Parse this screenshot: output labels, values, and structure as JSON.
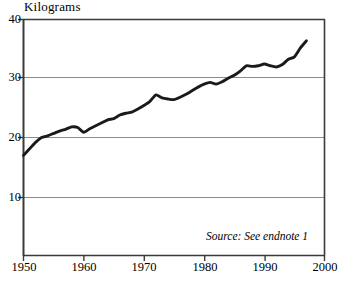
{
  "chart_data": {
    "type": "line",
    "title": "",
    "ylabel": "Kilograms",
    "xlabel": "",
    "ylim": [
      0,
      40
    ],
    "xlim": [
      1950,
      2000
    ],
    "ytick_labels": [
      "40",
      "30",
      "20",
      "10"
    ],
    "ytick_values": [
      40,
      30,
      20,
      10
    ],
    "xtick_labels": [
      "1950",
      "1960",
      "1970",
      "1980",
      "1990",
      "2000"
    ],
    "xtick_values": [
      1950,
      1960,
      1970,
      1980,
      1990,
      2000
    ],
    "grid": "horizontal",
    "legend": "none",
    "annotations": [
      {
        "name": "source-note",
        "text": "Source: See endnote 1"
      }
    ],
    "series": [
      {
        "name": "Kilograms per person",
        "color": "#1a1a1a",
        "x": [
          1950,
          1951,
          1952,
          1953,
          1954,
          1955,
          1956,
          1957,
          1958,
          1959,
          1960,
          1961,
          1962,
          1963,
          1964,
          1965,
          1966,
          1967,
          1968,
          1969,
          1970,
          1971,
          1972,
          1973,
          1974,
          1975,
          1976,
          1977,
          1978,
          1979,
          1980,
          1981,
          1982,
          1983,
          1984,
          1985,
          1986,
          1987,
          1988,
          1989,
          1990,
          1991,
          1992,
          1993,
          1994,
          1995,
          1996,
          1997
        ],
        "values": [
          17.1,
          18.2,
          19.3,
          20.1,
          20.4,
          20.8,
          21.2,
          21.5,
          21.9,
          21.8,
          21.0,
          21.6,
          22.1,
          22.6,
          23.1,
          23.3,
          23.9,
          24.2,
          24.4,
          24.9,
          25.5,
          26.2,
          27.3,
          26.8,
          26.6,
          26.5,
          26.9,
          27.4,
          28.0,
          28.6,
          29.1,
          29.4,
          29.1,
          29.5,
          30.1,
          30.6,
          31.3,
          32.2,
          32.1,
          32.2,
          32.5,
          32.2,
          32.0,
          32.4,
          33.3,
          33.7,
          35.2,
          36.4
        ]
      }
    ]
  },
  "axis_title": "Kilograms",
  "source_note": "Source: See endnote 1",
  "colors": {
    "line": "#1a1a1a",
    "axis": "#3a3a3a",
    "grid": "#8c8c8c",
    "background": "#ffffff"
  }
}
